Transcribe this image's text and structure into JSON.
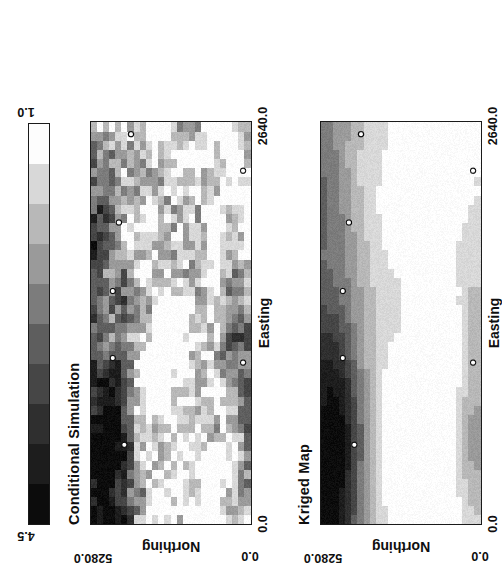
{
  "figure": {
    "orientation_deg": -90,
    "background": "#ffffff",
    "ink": "#111111"
  },
  "colorbar": {
    "name": "shared-grayscale-colorbar",
    "max_label": "4.5",
    "min_label": "1.0",
    "orientation": "horizontal",
    "n_bands": 10,
    "band_colors": [
      "#0c0c0c",
      "#1d1d1d",
      "#2f2f2f",
      "#464646",
      "#5e5e5e",
      "#7c7c7c",
      "#9a9a9a",
      "#b8b8b8",
      "#d8d8d8",
      "#fdfdfd"
    ]
  },
  "panels": [
    {
      "id": "conditional-simulation",
      "title": "Conditional Simulation",
      "xlabel": "Easting",
      "ylabel": "Northing",
      "xticks": [
        "0.0",
        "2640.0"
      ],
      "yticks": [
        "0.0",
        "5280.0"
      ],
      "xlim": [
        0.0,
        2640.0
      ],
      "ylim": [
        0.0,
        5280.0
      ],
      "render": "stochastic-pixel-grid"
    },
    {
      "id": "kriged-map",
      "title": "Kriged Map",
      "xlabel": "Easting",
      "ylabel": "Northing",
      "xticks": [
        "0.0",
        "2640.0"
      ],
      "yticks": [
        "0.0",
        "5280.0"
      ],
      "xlim": [
        0.0,
        2640.0
      ],
      "ylim": [
        0.0,
        5280.0
      ],
      "render": "smooth-contour-grid"
    }
  ],
  "chart_data": {
    "type": "heatmap",
    "xlabel": "Easting",
    "ylabel": "Northing",
    "xlim": [
      0.0,
      2640.0
    ],
    "ylim": [
      0.0,
      5280.0
    ],
    "xtick_labels": [
      "0.0",
      "2640.0"
    ],
    "ytick_labels": [
      "0.0",
      "5280.0"
    ],
    "grid": false,
    "legend": "shared horizontal grayscale colorbar, 4.5 (black) to 1.0 (white)",
    "colorbar_range": [
      1.0,
      4.5
    ],
    "colorbar_max": 4.5,
    "colorbar_min": 1.0,
    "nx": 44,
    "ny": 26,
    "maps": [
      {
        "name": "Kriged Map",
        "description": "Smooth kriged estimate; high values (dark, 3.5-4.5) concentrated along the upper-left / high-Northing edge, a secondary moderate band (2.0-2.8) along the low-Northing low-Easting margin, and a broad low-value plateau (1.0-1.6) through the centre and right.",
        "value_range": [
          1.0,
          4.5
        ],
        "n_samples": 6
      },
      {
        "name": "Conditional Simulation",
        "description": "Stochastic conditional realization reproducing the kriged trend with full short-scale variability; dark high-value patches along the high-Northing edge and a second dark cluster in the low-Northing centre, speckled light/white patches elsewhere.",
        "value_range": [
          1.0,
          4.5
        ],
        "n_samples": 6
      }
    ],
    "sample_points": [
      {
        "easting": 520,
        "northing": 4180
      },
      {
        "easting": 1090,
        "northing": 4560
      },
      {
        "easting": 1530,
        "northing": 4560
      },
      {
        "easting": 1980,
        "northing": 4360
      },
      {
        "easting": 2560,
        "northing": 3960
      },
      {
        "easting": 1060,
        "northing": 260
      },
      {
        "easting": 2320,
        "northing": 260
      }
    ]
  }
}
